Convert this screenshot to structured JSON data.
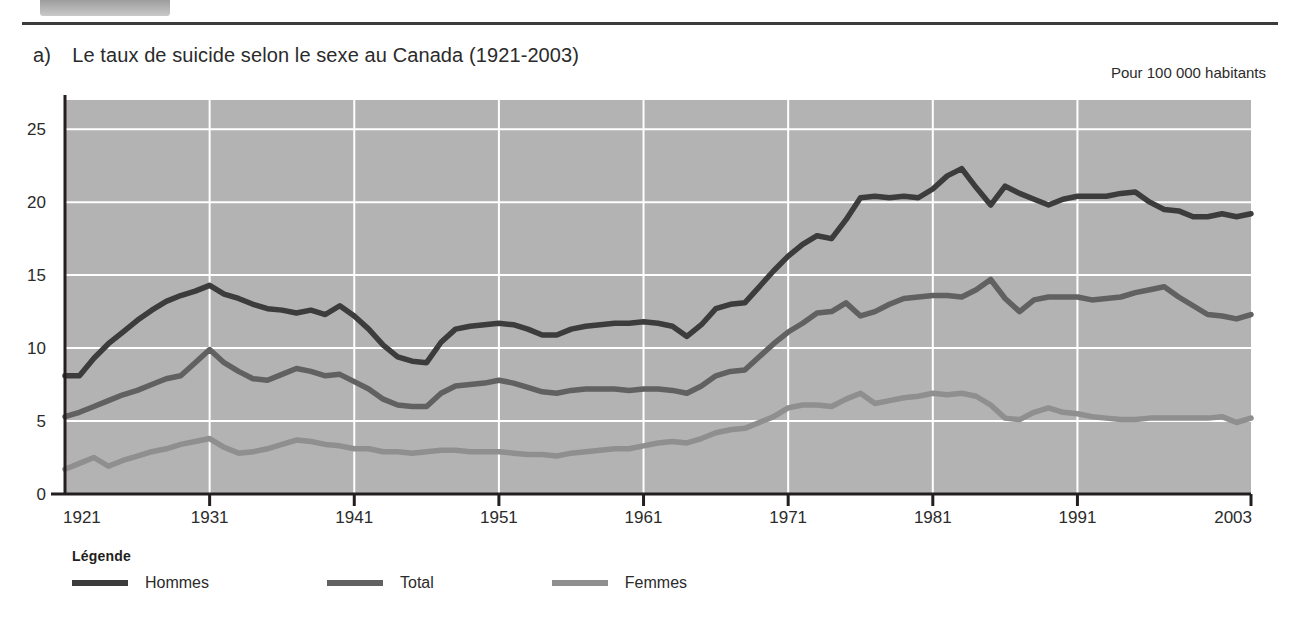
{
  "banner": {
    "dot_icon": "bullet-dot-icon"
  },
  "figure": {
    "marker": "a)",
    "title": "Le taux de suicide selon le sexe au Canada (1921-2003)",
    "units_caption": "Pour 100 000 habitants"
  },
  "legend": {
    "title": "Légende",
    "items": [
      {
        "label": "Hommes",
        "color": "#3c3c3c"
      },
      {
        "label": "Total",
        "color": "#616161"
      },
      {
        "label": "Femmes",
        "color": "#8f8f8f"
      }
    ]
  },
  "colors": {
    "plot_background": "#b3b3b3",
    "gridline": "#ffffff",
    "axis": "#231f20",
    "hommes": "#3c3c3c",
    "total": "#616161",
    "femmes": "#8f8f8f",
    "text": "#2b2b2b"
  },
  "chart_data": {
    "type": "line",
    "title": "Le taux de suicide selon le sexe au Canada (1921-2003)",
    "subtitle": "Pour 100 000 habitants",
    "xlabel": "",
    "ylabel": "Pour 100 000 habitants",
    "xlim": [
      1921,
      2003
    ],
    "ylim": [
      0,
      27
    ],
    "yticks": [
      0,
      5,
      10,
      15,
      20,
      25
    ],
    "xticks": [
      1921,
      1931,
      1941,
      1951,
      1961,
      1971,
      1981,
      1991,
      2003
    ],
    "grid": "both",
    "legend_position": "below-left",
    "x": [
      1921,
      1922,
      1923,
      1924,
      1925,
      1926,
      1927,
      1928,
      1929,
      1930,
      1931,
      1932,
      1933,
      1934,
      1935,
      1936,
      1937,
      1938,
      1939,
      1940,
      1941,
      1942,
      1943,
      1944,
      1945,
      1946,
      1947,
      1948,
      1949,
      1950,
      1951,
      1952,
      1953,
      1954,
      1955,
      1956,
      1957,
      1958,
      1959,
      1960,
      1961,
      1962,
      1963,
      1964,
      1965,
      1966,
      1967,
      1968,
      1969,
      1970,
      1971,
      1972,
      1973,
      1974,
      1975,
      1976,
      1977,
      1978,
      1979,
      1980,
      1981,
      1982,
      1983,
      1984,
      1985,
      1986,
      1987,
      1988,
      1989,
      1990,
      1991,
      1992,
      1993,
      1994,
      1995,
      1996,
      1997,
      1998,
      1999,
      2000,
      2001,
      2002,
      2003
    ],
    "series": [
      {
        "name": "Hommes",
        "color": "#3c3c3c",
        "values": [
          8.1,
          8.1,
          9.3,
          10.3,
          11.1,
          11.9,
          12.6,
          13.2,
          13.6,
          13.9,
          14.3,
          13.7,
          13.4,
          13.0,
          12.7,
          12.6,
          12.4,
          12.6,
          12.3,
          12.9,
          12.2,
          11.3,
          10.2,
          9.4,
          9.1,
          9.0,
          10.4,
          11.3,
          11.5,
          11.6,
          11.7,
          11.6,
          11.3,
          10.9,
          10.9,
          11.3,
          11.5,
          11.6,
          11.7,
          11.7,
          11.8,
          11.7,
          11.5,
          10.8,
          11.6,
          12.7,
          13.0,
          13.1,
          14.2,
          15.3,
          16.3,
          17.1,
          17.7,
          17.5,
          18.8,
          20.3,
          20.4,
          20.3,
          20.4,
          20.3,
          20.9,
          21.8,
          22.3,
          21.0,
          19.8,
          21.1,
          20.6,
          20.2,
          19.8,
          20.2,
          20.4,
          20.4,
          20.4,
          20.6,
          20.7,
          20.0,
          19.5,
          19.4,
          19.0,
          19.0,
          19.2,
          19.0,
          19.2
        ]
      },
      {
        "name": "Total",
        "color": "#616161",
        "values": [
          5.3,
          5.6,
          6.0,
          6.4,
          6.8,
          7.1,
          7.5,
          7.9,
          8.1,
          9.0,
          9.9,
          9.0,
          8.4,
          7.9,
          7.8,
          8.2,
          8.6,
          8.4,
          8.1,
          8.2,
          7.7,
          7.2,
          6.5,
          6.1,
          6.0,
          6.0,
          6.9,
          7.4,
          7.5,
          7.6,
          7.8,
          7.6,
          7.3,
          7.0,
          6.9,
          7.1,
          7.2,
          7.2,
          7.2,
          7.1,
          7.2,
          7.2,
          7.1,
          6.9,
          7.4,
          8.1,
          8.4,
          8.5,
          9.4,
          10.3,
          11.1,
          11.7,
          12.4,
          12.5,
          13.1,
          12.2,
          12.5,
          13.0,
          13.4,
          13.5,
          13.6,
          13.6,
          13.5,
          14.0,
          14.7,
          13.4,
          12.5,
          13.3,
          13.5,
          13.5,
          13.5,
          13.3,
          13.4,
          13.5,
          13.8,
          14.0,
          14.2,
          13.5,
          12.9,
          12.3,
          12.2,
          12.0,
          12.3
        ]
      },
      {
        "name": "Femmes",
        "color": "#8f8f8f",
        "values": [
          1.7,
          2.1,
          2.5,
          1.9,
          2.3,
          2.6,
          2.9,
          3.1,
          3.4,
          3.6,
          3.8,
          3.2,
          2.8,
          2.9,
          3.1,
          3.4,
          3.7,
          3.6,
          3.4,
          3.3,
          3.1,
          3.1,
          2.9,
          2.9,
          2.8,
          2.9,
          3.0,
          3.0,
          2.9,
          2.9,
          2.9,
          2.8,
          2.7,
          2.7,
          2.6,
          2.8,
          2.9,
          3.0,
          3.1,
          3.1,
          3.3,
          3.5,
          3.6,
          3.5,
          3.8,
          4.2,
          4.4,
          4.5,
          4.9,
          5.3,
          5.9,
          6.1,
          6.1,
          6.0,
          6.5,
          6.9,
          6.2,
          6.4,
          6.6,
          6.7,
          6.9,
          6.8,
          6.9,
          6.7,
          6.1,
          5.2,
          5.1,
          5.6,
          5.9,
          5.6,
          5.5,
          5.3,
          5.2,
          5.1,
          5.1,
          5.2,
          5.2,
          5.2,
          5.2,
          5.2,
          5.3,
          4.9,
          5.2
        ]
      }
    ]
  }
}
